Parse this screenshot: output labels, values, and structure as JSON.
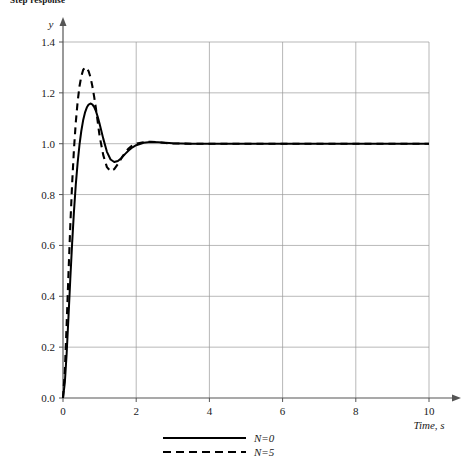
{
  "chart_data": {
    "type": "line",
    "title": "Step response",
    "xlabel": "Time, s",
    "ylabel": "y",
    "xlim": [
      0,
      10
    ],
    "ylim": [
      0,
      1.45
    ],
    "grid": true,
    "legend_position": "bottom",
    "xticks": [
      "0",
      "2",
      "4",
      "6",
      "8",
      "10"
    ],
    "xtick_values": [
      0,
      2,
      4,
      6,
      8,
      10
    ],
    "yticks": [
      "0.0",
      "0.2",
      "0.4",
      "0.6",
      "0.8",
      "1.0",
      "1.2",
      "1.4"
    ],
    "ytick_values": [
      0.0,
      0.2,
      0.4,
      0.6,
      0.8,
      1.0,
      1.2,
      1.4
    ],
    "series": [
      {
        "name": "N=0",
        "style": "solid",
        "color": "#000000",
        "x": [
          0.0,
          0.05,
          0.1,
          0.15,
          0.2,
          0.25,
          0.3,
          0.35,
          0.4,
          0.45,
          0.5,
          0.55,
          0.6,
          0.65,
          0.7,
          0.75,
          0.8,
          0.85,
          0.9,
          0.95,
          1.0,
          1.1,
          1.2,
          1.3,
          1.4,
          1.5,
          1.6,
          1.7,
          1.8,
          1.9,
          2.0,
          2.2,
          2.4,
          2.6,
          2.8,
          3.0,
          3.5,
          4.0,
          5.0,
          6.0,
          7.0,
          8.0,
          9.0,
          10.0
        ],
        "y": [
          0.0,
          0.06,
          0.175,
          0.32,
          0.47,
          0.61,
          0.735,
          0.84,
          0.925,
          0.995,
          1.05,
          1.092,
          1.122,
          1.142,
          1.154,
          1.158,
          1.155,
          1.145,
          1.128,
          1.105,
          1.078,
          1.02,
          0.968,
          0.938,
          0.928,
          0.932,
          0.944,
          0.96,
          0.974,
          0.986,
          0.994,
          1.004,
          1.007,
          1.006,
          1.004,
          1.002,
          1.0,
          1.0,
          1.0,
          1.0,
          1.0,
          1.0,
          1.0,
          1.0
        ]
      },
      {
        "name": "N=5",
        "style": "dashed",
        "color": "#000000",
        "x": [
          0.0,
          0.05,
          0.1,
          0.15,
          0.2,
          0.25,
          0.3,
          0.35,
          0.4,
          0.45,
          0.5,
          0.55,
          0.6,
          0.65,
          0.7,
          0.75,
          0.8,
          0.85,
          0.9,
          0.95,
          1.0,
          1.1,
          1.2,
          1.3,
          1.4,
          1.5,
          1.6,
          1.7,
          1.8,
          1.9,
          2.0,
          2.2,
          2.4,
          2.6,
          2.8,
          3.0,
          3.5,
          4.0,
          5.0,
          6.0,
          7.0,
          8.0,
          9.0,
          10.0
        ],
        "y": [
          0.0,
          0.105,
          0.29,
          0.49,
          0.68,
          0.845,
          0.98,
          1.085,
          1.165,
          1.225,
          1.265,
          1.29,
          1.3,
          1.298,
          1.285,
          1.262,
          1.228,
          1.186,
          1.138,
          1.085,
          1.03,
          0.955,
          0.908,
          0.892,
          0.9,
          0.92,
          0.944,
          0.966,
          0.982,
          0.994,
          1.0,
          1.006,
          1.008,
          1.006,
          1.003,
          1.001,
          1.0,
          1.0,
          1.0,
          1.0,
          1.0,
          1.0,
          1.0,
          1.0
        ]
      }
    ],
    "legend": [
      {
        "label": "N=0",
        "style": "solid"
      },
      {
        "label": "N=5",
        "style": "dashed"
      }
    ],
    "colors": {
      "curve": "#000000",
      "grid": "#9a9a9a",
      "axis": "#555555",
      "text": "#1a1a1a",
      "background": "#ffffff"
    }
  }
}
